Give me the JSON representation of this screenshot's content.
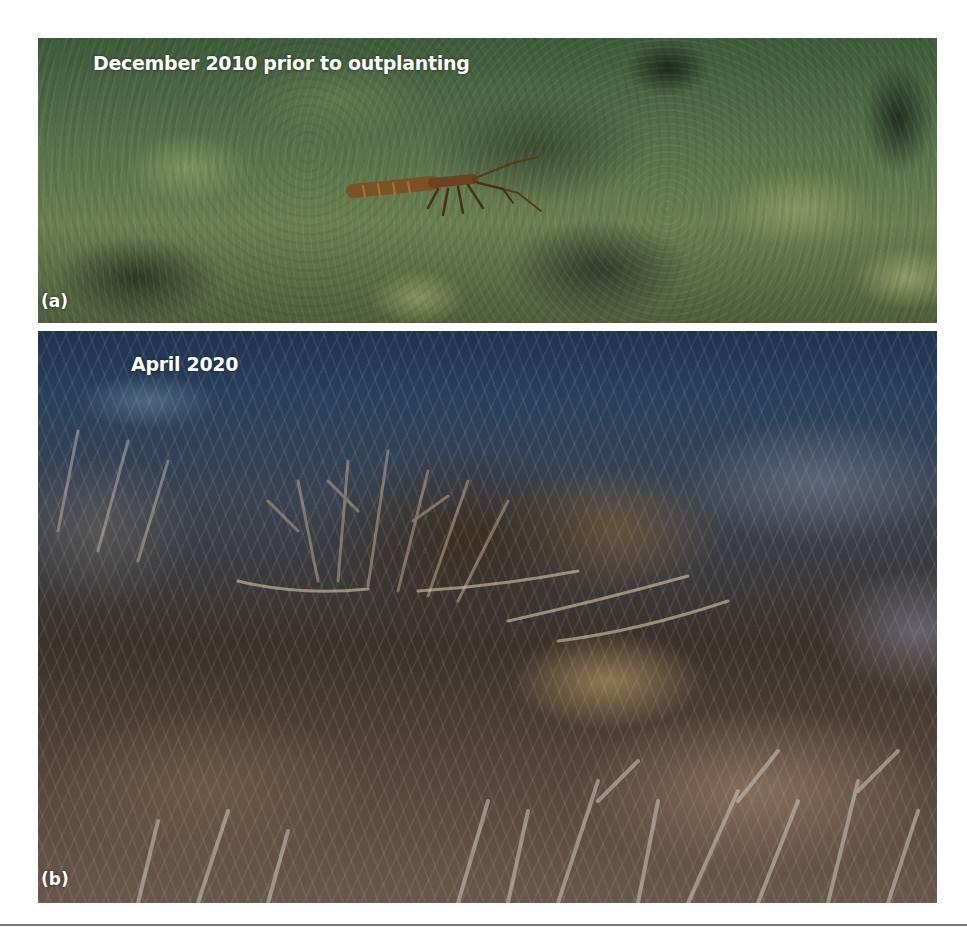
{
  "figure": {
    "panels": [
      {
        "id": "a",
        "label": "(a)",
        "caption": "December 2010 prior to outplanting",
        "scene": "degraded rubble reef with algae and a spiny lobster",
        "dominant_colors": [
          "#3d5a3a",
          "#6a7f52",
          "#b7b27c"
        ]
      },
      {
        "id": "b",
        "label": "(b)",
        "caption": "April 2020",
        "scene": "dense restored staghorn and elkhorn coral thicket",
        "dominant_colors": [
          "#1f3350",
          "#3a3128",
          "#8c735f",
          "#c9c3bd"
        ]
      }
    ]
  },
  "footer_rule_color": "#7a7a7a"
}
